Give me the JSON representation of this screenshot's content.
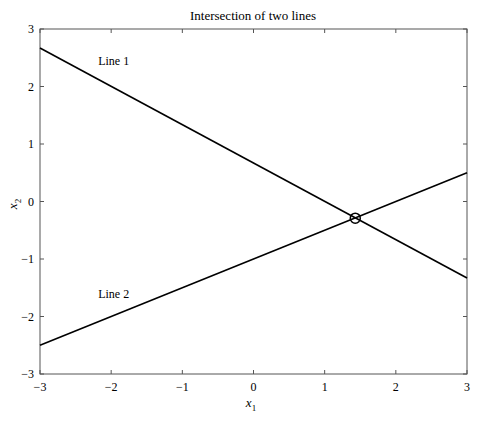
{
  "chart_data": {
    "type": "line",
    "title": "Intersection of two lines",
    "xlabel": "x1",
    "ylabel": "x2",
    "xlabel_main": "x",
    "xlabel_sub": "1",
    "ylabel_main": "x",
    "ylabel_sub": "2",
    "xlim": [
      -3,
      3
    ],
    "ylim": [
      -3,
      3
    ],
    "xticks": [
      -3,
      -2,
      -1,
      0,
      1,
      2,
      3
    ],
    "yticks": [
      -3,
      -2,
      -1,
      0,
      1,
      2,
      3
    ],
    "xtick_labels": [
      "−3",
      "−2",
      "−1",
      "0",
      "1",
      "2",
      "3"
    ],
    "ytick_labels": [
      "−3",
      "−2",
      "−1",
      "0",
      "1",
      "2",
      "3"
    ],
    "grid": false,
    "legend": null,
    "series": [
      {
        "name": "Line 1",
        "x": [
          -3,
          3
        ],
        "y": [
          2.67,
          -1.33
        ],
        "color": "#000000",
        "label_pos": {
          "x": -2.0,
          "y": 2.45
        }
      },
      {
        "name": "Line 2",
        "x": [
          -3,
          3
        ],
        "y": [
          -2.5,
          0.5
        ],
        "color": "#000000",
        "label_pos": {
          "x": -2.0,
          "y": -1.6
        }
      }
    ],
    "annotations": [
      {
        "type": "circle-marker",
        "label": "intersection",
        "x": 1.43,
        "y": -0.29
      }
    ]
  }
}
